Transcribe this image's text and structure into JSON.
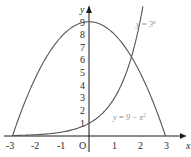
{
  "chart_data": {
    "type": "line",
    "title": "",
    "xlabel": "x",
    "ylabel": "y",
    "xlim": [
      -3,
      3
    ],
    "ylim": [
      0,
      9
    ],
    "grid": false,
    "x_ticks": [
      "-3",
      "-2",
      "-1",
      "O",
      "1",
      "2",
      "3"
    ],
    "y_ticks": [
      "1",
      "2",
      "3",
      "4",
      "5",
      "6",
      "7",
      "8",
      "9"
    ],
    "series": [
      {
        "name": "y = 9 − x²",
        "label": "y = 9 − x",
        "label_sup": "2",
        "x": [
          -3,
          -2,
          -1,
          0,
          1,
          2,
          3
        ],
        "values": [
          0,
          5,
          8,
          9,
          8,
          5,
          0
        ]
      },
      {
        "name": "y = 3ˣ",
        "label": "y = 3",
        "label_sup": "x",
        "x": [
          -3,
          -2,
          -1,
          0,
          1,
          1.5,
          2
        ],
        "values": [
          0.04,
          0.11,
          0.33,
          1,
          3,
          5.2,
          9
        ]
      }
    ]
  },
  "colors": {
    "axis": "#1a1a1a",
    "curve": "#555555",
    "label": "#8a8a8a"
  }
}
